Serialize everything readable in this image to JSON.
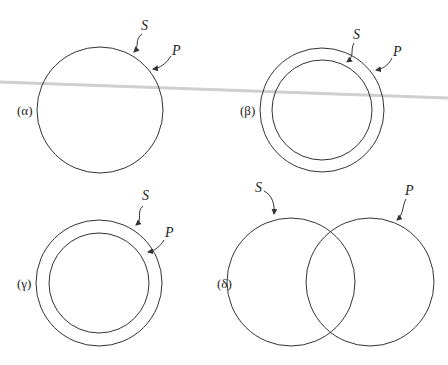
{
  "panels": [
    {
      "id": "alpha",
      "label": "(α)",
      "s_label": "S",
      "p_label": "P",
      "description": "S and P coincide (single circle)"
    },
    {
      "id": "beta",
      "label": "(β)",
      "s_label": "S",
      "p_label": "P",
      "description": "S inside P (S inner circle, P outer circle)"
    },
    {
      "id": "gamma",
      "label": "(γ)",
      "s_label": "S",
      "p_label": "P",
      "description": "P inside S (S outer circle, P inner circle)"
    },
    {
      "id": "delta",
      "label": "(δ)",
      "s_label": "S",
      "p_label": "P",
      "description": "S and P overlap partially"
    }
  ],
  "colors": {
    "stroke": "#333333",
    "scan_line": "#cfcfcf",
    "background": "#ffffff"
  }
}
